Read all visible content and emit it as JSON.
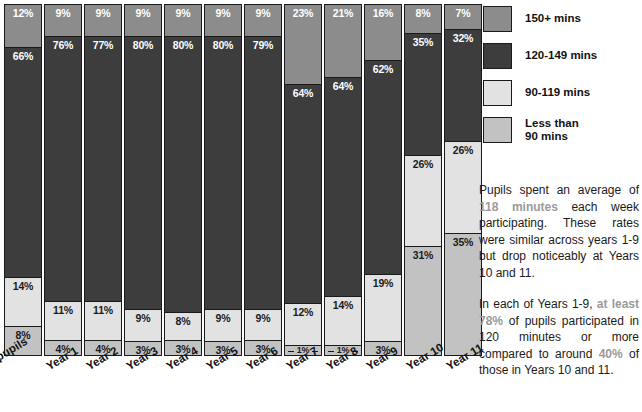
{
  "chart_data": {
    "type": "bar",
    "subtype": "100% stacked column",
    "title": "",
    "xlabel": "",
    "ylabel": "",
    "ylim": [
      0,
      100
    ],
    "grid": false,
    "legend_position": "right",
    "categories": [
      "All pupils",
      "Year 1",
      "Year 2",
      "Year 3",
      "Year 4",
      "Year 5",
      "Year 6",
      "Year 7",
      "Year 8",
      "Year 9",
      "Year 10",
      "Year 11"
    ],
    "series": [
      {
        "name": "150+ mins",
        "color": "#8c8c8c",
        "values": [
          12,
          9,
          9,
          9,
          9,
          9,
          9,
          23,
          21,
          16,
          8,
          7
        ],
        "labels": [
          "12%",
          "9%",
          "9%",
          "9%",
          "9%",
          "9%",
          "9%",
          "23%",
          "21%",
          "16%",
          "8%",
          "7%"
        ]
      },
      {
        "name": "120-149 mins",
        "color": "#3d3d3d",
        "values": [
          66,
          76,
          77,
          80,
          80,
          80,
          79,
          64,
          64,
          62,
          35,
          32
        ],
        "labels": [
          "66%",
          "76%",
          "77%",
          "80%",
          "80%",
          "80%",
          "79%",
          "64%",
          "64%",
          "62%",
          "35%",
          "32%"
        ]
      },
      {
        "name": "90-119 mins",
        "color": "#e2e2e2",
        "values": [
          14,
          11,
          11,
          9,
          8,
          9,
          9,
          12,
          14,
          19,
          26,
          26
        ],
        "labels": [
          "14%",
          "11%",
          "11%",
          "9%",
          "8%",
          "9%",
          "9%",
          "12%",
          "14%",
          "19%",
          "26%",
          "26%"
        ]
      },
      {
        "name": "Less than 90 mins",
        "color": "#c2c2c2",
        "values": [
          8,
          4,
          4,
          3,
          3,
          3,
          3,
          1,
          1,
          3,
          31,
          35
        ],
        "labels": [
          "8%",
          "4%",
          "4%",
          "3%",
          "3%",
          "3%",
          "3%",
          "1%",
          "1%",
          "3%",
          "31%",
          "35%"
        ]
      }
    ]
  },
  "legend": {
    "items": [
      {
        "label": "150+ mins",
        "color": "#8c8c8c"
      },
      {
        "label": "120-149 mins",
        "color": "#3d3d3d"
      },
      {
        "label": "90-119 mins",
        "color": "#e2e2e2"
      },
      {
        "label": "Less than\n90 mins",
        "color": "#c2c2c2"
      }
    ]
  },
  "annotations": {
    "paragraph_1": {
      "lead": "Pupils spent an average of ",
      "highlight": "118 minutes",
      "tail": " each week participating. These rates were similar across years 1-9 but drop noticeably at Years 10 and 11."
    },
    "paragraph_2": {
      "lead": "In each of Years 1-9, ",
      "highlight_1": "at least 78%",
      "middle": " of pupils participated in 120 minutes or more compared to around ",
      "highlight_2": "40%",
      "tail": " of those in Years 10 and 11."
    }
  },
  "colors": {
    "accent_highlight": "#9a9a9a",
    "outline": "#1a1a1a",
    "background": "#ffffff"
  }
}
